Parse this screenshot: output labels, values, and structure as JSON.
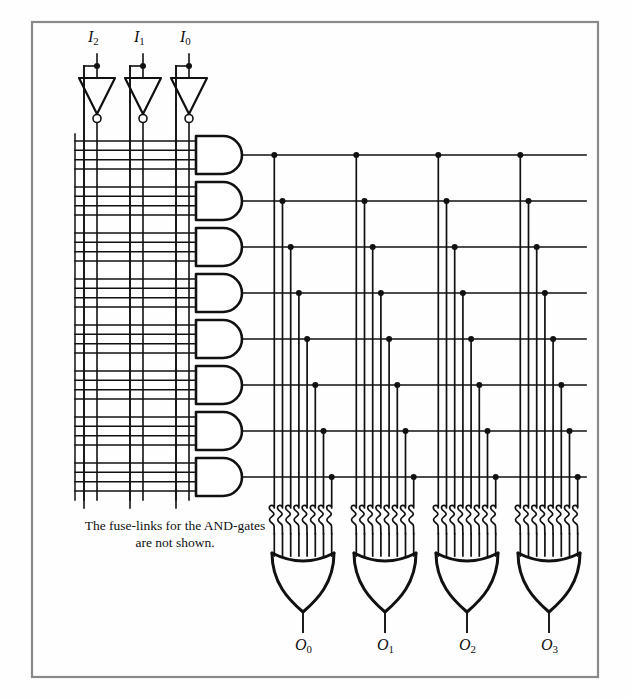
{
  "figure": {
    "kind": "prom-pla-logic-diagram",
    "caption": "The fuse-links for the AND-gates are not shown.",
    "caption_line1": "The fuse-links for the AND-gates",
    "caption_line2": "are not shown.",
    "frame_color": "#8a8a8a",
    "wire_color": "#111111",
    "background": "#fefefe"
  },
  "inputs": {
    "count": 3,
    "labels": [
      "I2",
      "I1",
      "I0"
    ],
    "label_base": [
      "I",
      "I",
      "I"
    ],
    "label_sub": [
      "2",
      "1",
      "0"
    ],
    "items": [
      {
        "name": "input-i2",
        "base": "I",
        "sub": "2",
        "x": 97,
        "label_x": 88,
        "label_y": 36
      },
      {
        "name": "input-i1",
        "base": "I",
        "sub": "1",
        "x": 143,
        "label_x": 134,
        "label_y": 36
      },
      {
        "name": "input-i0",
        "base": "I",
        "sub": "0",
        "x": 189,
        "label_x": 180,
        "label_y": 36
      }
    ],
    "inverter_symbol": "triangle-with-bubble",
    "bubble_label": "inverting-bubble"
  },
  "and_array": {
    "gate_count": 8,
    "gate_label": "AND-gate",
    "lines_per_gate": 4,
    "vertical_rails": 6,
    "shape": "d-shaped-and-gate",
    "rows": [
      {
        "name": "and-gate-1",
        "y": 155
      },
      {
        "name": "and-gate-2",
        "y": 201
      },
      {
        "name": "and-gate-3",
        "y": 247
      },
      {
        "name": "and-gate-4",
        "y": 293
      },
      {
        "name": "and-gate-5",
        "y": 339
      },
      {
        "name": "and-gate-6",
        "y": 385
      },
      {
        "name": "and-gate-7",
        "y": 431
      },
      {
        "name": "and-gate-8",
        "y": 477
      }
    ]
  },
  "or_array": {
    "gate_count": 4,
    "gate_label": "OR-gate",
    "fuse_links_per_gate": 8,
    "fuse_symbol": "fuse-link-loop",
    "shape": "downward-or-gate",
    "outputs": [
      {
        "name": "output-o0",
        "base": "O",
        "sub": "0",
        "gate_x": 303,
        "label_x": 295,
        "label_y": 645
      },
      {
        "name": "output-o1",
        "base": "O",
        "sub": "1",
        "gate_x": 385,
        "label_x": 377,
        "label_y": 645
      },
      {
        "name": "output-o2",
        "base": "O",
        "sub": "2",
        "gate_x": 467,
        "label_x": 459,
        "label_y": 645
      },
      {
        "name": "output-o3",
        "base": "O",
        "sub": "3",
        "gate_x": 549,
        "label_x": 541,
        "label_y": 645
      }
    ],
    "labels": [
      "O0",
      "O1",
      "O2",
      "O3"
    ]
  },
  "caption_pos": {
    "x": 68,
    "y": 520,
    "width": 210
  }
}
